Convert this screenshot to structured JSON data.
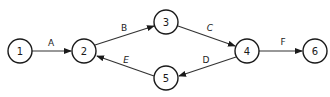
{
  "diagram": {
    "type": "activity-on-arrow network",
    "nodes": [
      {
        "id": "1",
        "label": "1",
        "x": 20,
        "y": 51
      },
      {
        "id": "2",
        "label": "2",
        "x": 84,
        "y": 51
      },
      {
        "id": "3",
        "label": "3",
        "x": 166,
        "y": 22
      },
      {
        "id": "4",
        "label": "4",
        "x": 247,
        "y": 51
      },
      {
        "id": "5",
        "label": "5",
        "x": 166,
        "y": 78
      },
      {
        "id": "6",
        "label": "6",
        "x": 315,
        "y": 51
      }
    ],
    "edges": [
      {
        "from": "1",
        "to": "2",
        "label": "A"
      },
      {
        "from": "2",
        "to": "3",
        "label": "B"
      },
      {
        "from": "3",
        "to": "4",
        "label": "C"
      },
      {
        "from": "4",
        "to": "5",
        "label": "D"
      },
      {
        "from": "5",
        "to": "2",
        "label": "E"
      },
      {
        "from": "4",
        "to": "6",
        "label": "F"
      }
    ]
  }
}
